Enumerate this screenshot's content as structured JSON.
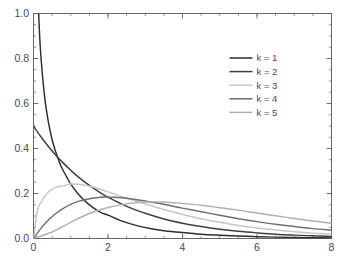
{
  "chart_data": {
    "type": "line",
    "title": "",
    "subtitle": "",
    "xlabel": "",
    "ylabel": "",
    "xlim": [
      0,
      8
    ],
    "ylim": [
      0,
      1.0
    ],
    "grid": false,
    "legend_position": "upper right",
    "x_ticks": [
      0,
      2,
      4,
      6,
      8
    ],
    "x_tick_labels": [
      "0",
      "2",
      "4",
      "6",
      "8"
    ],
    "x_minor_step": 0.5,
    "y_ticks": [
      0.0,
      0.2,
      0.4,
      0.6,
      0.8,
      1.0
    ],
    "y_tick_labels": [
      "0.0",
      "0.2",
      "0.4",
      "0.6",
      "0.8",
      "1.0"
    ],
    "y_minor_step": 0.05,
    "series": [
      {
        "name": "k = 1",
        "color": "#2e2e2e",
        "x": [
          0.02,
          0.05,
          0.1,
          0.15,
          0.2,
          0.3,
          0.4,
          0.5,
          0.6,
          0.7,
          0.8,
          0.9,
          1.0,
          1.2,
          1.4,
          1.6,
          1.8,
          2.0,
          2.4,
          2.8,
          3.2,
          3.6,
          4.0,
          4.5,
          5.0,
          5.5,
          6.0,
          6.5,
          7.0,
          7.5,
          8.0
        ],
        "y": [
          2.805,
          1.753,
          1.2,
          0.955,
          0.807,
          0.628,
          0.517,
          0.439,
          0.383,
          0.337,
          0.301,
          0.271,
          0.242,
          0.198,
          0.164,
          0.137,
          0.116,
          0.104,
          0.076,
          0.056,
          0.042,
          0.032,
          0.027,
          0.019,
          0.0146,
          0.0113,
          0.0081,
          0.0061,
          0.0046,
          0.0035,
          0.0026
        ]
      },
      {
        "name": "k = 2",
        "color": "#3f3f3f",
        "x": [
          0.0,
          0.2,
          0.4,
          0.6,
          0.8,
          1.0,
          1.2,
          1.5,
          1.8,
          2.0,
          2.5,
          3.0,
          3.5,
          4.0,
          4.5,
          5.0,
          5.5,
          6.0,
          6.5,
          7.0,
          7.5,
          8.0
        ],
        "y": [
          0.5,
          0.452,
          0.409,
          0.37,
          0.335,
          0.303,
          0.274,
          0.236,
          0.203,
          0.184,
          0.143,
          0.112,
          0.087,
          0.068,
          0.053,
          0.041,
          0.032,
          0.025,
          0.019,
          0.015,
          0.012,
          0.009
        ]
      },
      {
        "name": "k = 3",
        "color": "#c6c6c6",
        "x": [
          0.0,
          0.1,
          0.2,
          0.4,
          0.6,
          0.8,
          1.0,
          1.2,
          1.4,
          1.6,
          1.8,
          2.0,
          2.5,
          3.0,
          3.5,
          4.0,
          4.5,
          5.0,
          5.5,
          6.0,
          6.5,
          7.0,
          7.5,
          8.0
        ],
        "y": [
          0.0,
          0.12,
          0.161,
          0.207,
          0.227,
          0.234,
          0.242,
          0.241,
          0.236,
          0.229,
          0.219,
          0.207,
          0.179,
          0.154,
          0.129,
          0.107,
          0.088,
          0.072,
          0.058,
          0.047,
          0.038,
          0.03,
          0.024,
          0.019
        ]
      },
      {
        "name": "k = 4",
        "color": "#6e6e6e",
        "x": [
          0.0,
          0.2,
          0.4,
          0.6,
          0.8,
          1.0,
          1.2,
          1.5,
          1.8,
          2.0,
          2.2,
          2.5,
          3.0,
          3.5,
          4.0,
          4.5,
          5.0,
          5.5,
          6.0,
          6.5,
          7.0,
          7.5,
          8.0
        ],
        "y": [
          0.0,
          0.045,
          0.082,
          0.111,
          0.134,
          0.152,
          0.165,
          0.177,
          0.183,
          0.184,
          0.183,
          0.179,
          0.167,
          0.152,
          0.135,
          0.119,
          0.103,
          0.088,
          0.075,
          0.063,
          0.053,
          0.044,
          0.037
        ]
      },
      {
        "name": "k = 5",
        "color": "#b0b0b0",
        "x": [
          0.0,
          0.5,
          1.0,
          1.5,
          2.0,
          2.5,
          3.0,
          3.5,
          4.0,
          4.5,
          5.0,
          5.5,
          6.0,
          6.5,
          7.0,
          7.5,
          8.0
        ],
        "y": [
          0.0,
          0.029,
          0.072,
          0.111,
          0.138,
          0.154,
          0.162,
          0.162,
          0.156,
          0.148,
          0.137,
          0.126,
          0.113,
          0.101,
          0.089,
          0.078,
          0.068
        ]
      }
    ]
  },
  "legend": {
    "entries": [
      {
        "label": "k = 1"
      },
      {
        "label": "k = 2"
      },
      {
        "label": "k = 3"
      },
      {
        "label": "k = 4"
      },
      {
        "label": "k = 5"
      }
    ]
  },
  "axes": {
    "x_tick_labels": [
      "0",
      "2",
      "4",
      "6",
      "8"
    ],
    "y_tick_labels": [
      "0.0",
      "0.2",
      "0.4",
      "0.6",
      "0.8",
      "1.0"
    ]
  },
  "style": {
    "frame_color": "#666666",
    "background": "#ffffff",
    "text_color": "#4a4a4a"
  }
}
